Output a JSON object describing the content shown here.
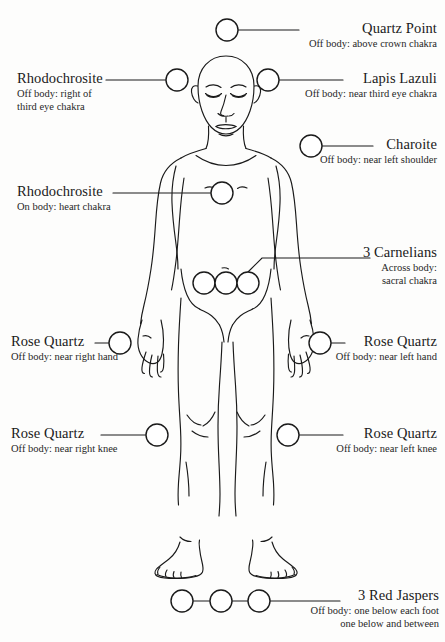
{
  "diagram": {
    "type": "body-crystal-layout",
    "view": "front",
    "line_color": "#1a1a1a",
    "marker_fill": "#ffffff",
    "background": "#fdfdfc",
    "marker_count": 13
  },
  "callouts": [
    {
      "id": "quartz-point",
      "title": "Quartz Point",
      "sub": "Off body: above crown chakra",
      "align": "left",
      "marker": {
        "cx": 227,
        "cy": 30,
        "r": 11
      },
      "leader": {
        "x1": 238,
        "y1": 30,
        "x2": 299,
        "y2": 30
      },
      "text_x": 308,
      "text_y": 20
    },
    {
      "id": "rhodochrosite-third-eye",
      "title": "Rhodochrosite",
      "sub": "Off body: right of\nthird eye chakra",
      "align": "right",
      "marker": {
        "cx": 177,
        "cy": 80,
        "r": 11
      },
      "leader": {
        "x1": 166,
        "y1": 80,
        "x2": 106,
        "y2": 80
      },
      "text_x": 18,
      "text_y": 70
    },
    {
      "id": "lapis-lazuli",
      "title": "Lapis Lazuli",
      "sub": "Off body: near third eye chakra",
      "align": "left",
      "marker": {
        "cx": 268,
        "cy": 80,
        "r": 11
      },
      "leader": {
        "x1": 279,
        "y1": 80,
        "x2": 343,
        "y2": 80
      },
      "text_x": 300,
      "text_y": 70
    },
    {
      "id": "charoite",
      "title": "Charoite",
      "sub": "Off body: near left shoulder",
      "align": "left",
      "marker": {
        "cx": 311,
        "cy": 146,
        "r": 11
      },
      "leader": {
        "x1": 322,
        "y1": 146,
        "x2": 373,
        "y2": 146
      },
      "text_x": 305,
      "text_y": 136
    },
    {
      "id": "rhodochrosite-heart",
      "title": "Rhodochrosite",
      "sub": "On body: heart chakra",
      "align": "right",
      "marker": {
        "cx": 222,
        "cy": 193,
        "r": 11
      },
      "leader": {
        "x1": 211,
        "y1": 193,
        "x2": 113,
        "y2": 193
      },
      "text_x": 18,
      "text_y": 183
    },
    {
      "id": "carnelians",
      "title": "3 Carnelians",
      "sub": "Across body:\nsacral chakra",
      "align": "right",
      "marker": {
        "cx": 246,
        "cy": 283,
        "r": 11
      },
      "text_x": 338,
      "text_y": 244
    },
    {
      "id": "rose-quartz-right-hand",
      "title": "Rose Quartz",
      "sub": "Off body: near right hand",
      "align": "right",
      "marker": {
        "cx": 120,
        "cy": 343,
        "r": 11
      },
      "leader": {
        "x1": 109,
        "y1": 343,
        "x2": 95,
        "y2": 343
      },
      "text_x": 11,
      "text_y": 333
    },
    {
      "id": "rose-quartz-left-hand",
      "title": "Rose Quartz",
      "sub": "Off body: near left hand",
      "align": "left",
      "marker": {
        "cx": 320,
        "cy": 343,
        "r": 11
      },
      "leader": {
        "x1": 331,
        "y1": 343,
        "x2": 345,
        "y2": 343
      },
      "text_x": 322,
      "text_y": 333
    },
    {
      "id": "rose-quartz-right-knee",
      "title": "Rose Quartz",
      "sub": "Off body: near right knee",
      "align": "right",
      "marker": {
        "cx": 157,
        "cy": 435,
        "r": 11
      },
      "leader": {
        "x1": 146,
        "y1": 435,
        "x2": 101,
        "y2": 435
      },
      "text_x": 11,
      "text_y": 425
    },
    {
      "id": "rose-quartz-left-knee",
      "title": "Rose Quartz",
      "sub": "Off body: near left knee",
      "align": "left",
      "marker": {
        "cx": 288,
        "cy": 435,
        "r": 11
      },
      "leader": {
        "x1": 299,
        "y1": 435,
        "x2": 343,
        "y2": 435
      },
      "text_x": 324,
      "text_y": 425
    },
    {
      "id": "red-jaspers",
      "title": "3 Red Jaspers",
      "sub": "Off body: one below each foot\none below and between",
      "align": "left",
      "marker": {
        "cx": 259,
        "cy": 601,
        "r": 11
      },
      "leader": {
        "x1": 270,
        "y1": 601,
        "x2": 340,
        "y2": 601
      },
      "text_x": 290,
      "text_y": 590
    }
  ],
  "markers": {
    "carnelian_group": [
      {
        "cx": 204,
        "cy": 283,
        "r": 11
      },
      {
        "cx": 226,
        "cy": 283,
        "r": 11
      },
      {
        "cx": 248,
        "cy": 283,
        "r": 11
      }
    ],
    "jasper_group": [
      {
        "cx": 182,
        "cy": 601,
        "r": 11
      },
      {
        "cx": 221,
        "cy": 601,
        "r": 11
      },
      {
        "cx": 259,
        "cy": 601,
        "r": 11
      }
    ]
  }
}
